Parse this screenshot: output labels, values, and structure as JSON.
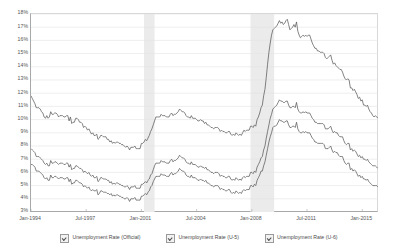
{
  "chart_data": {
    "type": "line",
    "title": "",
    "xlabel": "",
    "ylabel": "",
    "ylim": [
      3,
      18
    ],
    "grid": true,
    "legend_position": "bottom",
    "y_ticks": [
      "18%",
      "17%",
      "16%",
      "15%",
      "14%",
      "13%",
      "12%",
      "11%",
      "10%",
      "9%",
      "8%",
      "7%",
      "6%",
      "5%",
      "4%",
      "3%"
    ],
    "y_tick_values": [
      18,
      17,
      16,
      15,
      14,
      13,
      12,
      11,
      10,
      9,
      8,
      7,
      6,
      5,
      4,
      3
    ],
    "x_ticks": [
      "Jan-1994",
      "Jul-1997",
      "Jan-2001",
      "Jul-2004",
      "Jan-2008",
      "Jul-2011",
      "Jan-2015"
    ],
    "x_start": "Jan-1994",
    "x_end": "Jan-2016",
    "legend": [
      {
        "label": "Unemployment Rate (Official)",
        "checked": true,
        "color": "#5a5a5a"
      },
      {
        "label": "Unemployment Rate (U-5)",
        "checked": true,
        "color": "#5a5a5a"
      },
      {
        "label": "Unemployment Rate (U-6)",
        "checked": true,
        "color": "#5a5a5a"
      }
    ],
    "shaded_regions": [
      {
        "label": "Recession 2001",
        "start": "Mar-2001",
        "end": "Nov-2001",
        "color": "#ebebeb"
      },
      {
        "label": "Recession 2008",
        "start": "Dec-2007",
        "end": "Jun-2009",
        "color": "#ebebeb"
      }
    ],
    "series": [
      {
        "name": "Unemployment Rate (Official)",
        "values": [
          6.6,
          6.6,
          6.5,
          6.4,
          6.1,
          6.1,
          6.1,
          6.0,
          5.9,
          5.8,
          5.6,
          5.5,
          5.6,
          5.4,
          5.4,
          5.8,
          5.6,
          5.6,
          5.7,
          5.7,
          5.6,
          5.5,
          5.6,
          5.6,
          5.6,
          5.5,
          5.5,
          5.6,
          5.6,
          5.3,
          5.5,
          5.1,
          5.2,
          5.2,
          5.4,
          5.4,
          5.3,
          5.2,
          5.2,
          5.1,
          4.9,
          5.0,
          4.9,
          4.8,
          4.9,
          4.7,
          4.6,
          4.7,
          4.6,
          4.6,
          4.7,
          4.3,
          4.4,
          4.6,
          4.6,
          4.5,
          4.5,
          4.5,
          4.4,
          4.4,
          4.3,
          4.4,
          4.2,
          4.3,
          4.2,
          4.3,
          4.3,
          4.2,
          4.2,
          4.1,
          4.1,
          4.0,
          4.0,
          4.1,
          4.0,
          3.8,
          4.0,
          4.0,
          4.0,
          4.1,
          3.9,
          3.9,
          3.9,
          3.9,
          4.2,
          4.2,
          4.3,
          4.4,
          4.3,
          4.5,
          4.6,
          4.9,
          5.0,
          5.3,
          5.5,
          5.7,
          5.7,
          5.7,
          5.7,
          5.9,
          5.8,
          5.8,
          5.8,
          5.7,
          5.7,
          5.7,
          5.9,
          6.0,
          5.8,
          5.9,
          5.9,
          6.0,
          6.1,
          6.3,
          6.2,
          6.1,
          6.1,
          6.0,
          5.8,
          5.7,
          5.7,
          5.6,
          5.8,
          5.6,
          5.6,
          5.6,
          5.5,
          5.4,
          5.4,
          5.5,
          5.4,
          5.4,
          5.3,
          5.4,
          5.2,
          5.2,
          5.1,
          5.0,
          5.0,
          4.9,
          5.0,
          5.0,
          5.0,
          4.9,
          4.7,
          4.8,
          4.7,
          4.7,
          4.6,
          4.6,
          4.7,
          4.7,
          4.5,
          4.4,
          4.5,
          4.4,
          4.6,
          4.5,
          4.4,
          4.5,
          4.4,
          4.6,
          4.7,
          4.6,
          4.7,
          4.7,
          4.7,
          5.0,
          5.0,
          4.9,
          5.1,
          5.0,
          5.4,
          5.6,
          5.8,
          6.1,
          6.1,
          6.5,
          6.8,
          7.3,
          7.8,
          8.3,
          8.7,
          9.0,
          9.4,
          9.5,
          9.5,
          9.6,
          9.8,
          10.0,
          9.9,
          9.9,
          9.8,
          9.8,
          9.9,
          9.9,
          9.6,
          9.4,
          9.4,
          9.5,
          9.5,
          9.4,
          9.8,
          9.3,
          9.1,
          9.0,
          9.0,
          9.1,
          9.0,
          9.1,
          9.0,
          9.0,
          9.0,
          8.8,
          8.6,
          8.5,
          8.3,
          8.3,
          8.2,
          8.2,
          8.2,
          8.2,
          8.2,
          8.1,
          7.8,
          7.8,
          7.8,
          7.9,
          8.0,
          7.7,
          7.5,
          7.6,
          7.5,
          7.5,
          7.3,
          7.2,
          7.2,
          7.2,
          6.9,
          6.7,
          6.6,
          6.7,
          6.7,
          6.2,
          6.3,
          6.1,
          6.2,
          6.1,
          5.9,
          5.7,
          5.8,
          5.6,
          5.7,
          5.5,
          5.5,
          5.4,
          5.5,
          5.3,
          5.2,
          5.1,
          5.0,
          5.0,
          5.0,
          5.0,
          4.9
        ]
      },
      {
        "name": "Unemployment Rate (U-5)",
        "values": [
          7.8,
          7.7,
          7.6,
          7.5,
          7.2,
          7.2,
          7.2,
          7.1,
          7.0,
          6.9,
          6.7,
          6.6,
          6.7,
          6.5,
          6.5,
          6.9,
          6.7,
          6.7,
          6.8,
          6.8,
          6.7,
          6.6,
          6.7,
          6.7,
          6.7,
          6.6,
          6.6,
          6.7,
          6.7,
          6.4,
          6.6,
          6.2,
          6.3,
          6.3,
          6.5,
          6.5,
          6.4,
          6.3,
          6.3,
          6.2,
          6.0,
          6.1,
          6.0,
          5.9,
          6.0,
          5.8,
          5.7,
          5.8,
          5.6,
          5.6,
          5.7,
          5.3,
          5.4,
          5.6,
          5.6,
          5.5,
          5.5,
          5.5,
          5.4,
          5.4,
          5.2,
          5.3,
          5.1,
          5.2,
          5.1,
          5.2,
          5.2,
          5.1,
          5.1,
          5.0,
          5.0,
          4.9,
          4.9,
          5.0,
          4.9,
          4.7,
          4.9,
          4.9,
          4.9,
          5.0,
          4.8,
          4.8,
          4.8,
          4.8,
          5.1,
          5.1,
          5.2,
          5.3,
          5.2,
          5.4,
          5.5,
          5.8,
          5.9,
          6.2,
          6.5,
          6.7,
          6.7,
          6.7,
          6.7,
          6.9,
          6.8,
          6.8,
          6.8,
          6.7,
          6.7,
          6.7,
          6.9,
          7.0,
          6.8,
          6.9,
          6.9,
          7.0,
          7.1,
          7.3,
          7.2,
          7.1,
          7.1,
          7.0,
          6.8,
          6.7,
          6.7,
          6.6,
          6.8,
          6.6,
          6.6,
          6.6,
          6.5,
          6.4,
          6.4,
          6.5,
          6.4,
          6.4,
          6.3,
          6.4,
          6.2,
          6.2,
          6.1,
          6.0,
          6.0,
          5.9,
          6.0,
          6.0,
          6.0,
          5.9,
          5.7,
          5.8,
          5.7,
          5.7,
          5.6,
          5.6,
          5.7,
          5.7,
          5.5,
          5.4,
          5.5,
          5.4,
          5.6,
          5.5,
          5.4,
          5.5,
          5.4,
          5.6,
          5.7,
          5.6,
          5.7,
          5.7,
          5.7,
          6.0,
          6.0,
          5.9,
          6.1,
          6.0,
          6.4,
          6.6,
          6.8,
          7.1,
          7.2,
          7.7,
          8.0,
          8.6,
          9.1,
          9.6,
          10.1,
          10.4,
          10.8,
          10.9,
          11.0,
          11.1,
          11.3,
          11.5,
          11.4,
          11.4,
          11.3,
          11.3,
          11.4,
          11.4,
          11.1,
          10.9,
          10.9,
          11.0,
          11.0,
          10.9,
          11.3,
          10.8,
          10.6,
          10.5,
          10.5,
          10.6,
          10.5,
          10.6,
          10.5,
          10.5,
          10.5,
          10.3,
          10.1,
          10.0,
          9.8,
          9.8,
          9.7,
          9.7,
          9.7,
          9.7,
          9.7,
          9.6,
          9.3,
          9.3,
          9.3,
          9.4,
          9.5,
          9.2,
          9.0,
          9.1,
          9.0,
          9.0,
          8.8,
          8.7,
          8.7,
          8.7,
          8.4,
          8.2,
          8.1,
          8.2,
          8.2,
          7.7,
          7.8,
          7.6,
          7.7,
          7.6,
          7.4,
          7.2,
          7.3,
          7.1,
          7.2,
          7.0,
          7.0,
          6.9,
          7.0,
          6.8,
          6.7,
          6.6,
          6.5,
          6.5,
          6.5,
          6.4,
          6.3
        ]
      },
      {
        "name": "Unemployment Rate (U-6)",
        "values": [
          11.8,
          11.6,
          11.4,
          11.2,
          10.9,
          10.9,
          10.9,
          10.8,
          10.6,
          10.5,
          10.2,
          10.1,
          10.3,
          10.1,
          10.2,
          10.6,
          10.4,
          10.4,
          10.5,
          10.5,
          10.4,
          10.2,
          10.3,
          10.3,
          10.3,
          10.2,
          10.2,
          10.3,
          10.3,
          9.9,
          10.2,
          9.7,
          9.8,
          9.8,
          10.1,
          10.1,
          10.0,
          9.8,
          9.8,
          9.7,
          9.4,
          9.5,
          9.4,
          9.2,
          9.3,
          9.1,
          8.9,
          9.0,
          8.8,
          8.8,
          8.9,
          8.5,
          8.6,
          8.8,
          8.8,
          8.7,
          8.7,
          8.7,
          8.5,
          8.5,
          8.3,
          8.4,
          8.2,
          8.3,
          8.2,
          8.3,
          8.3,
          8.2,
          8.2,
          8.1,
          8.1,
          8.0,
          7.9,
          8.0,
          7.9,
          7.7,
          7.9,
          7.9,
          7.9,
          8.0,
          7.8,
          7.8,
          7.8,
          7.8,
          8.2,
          8.2,
          8.3,
          8.5,
          8.4,
          8.6,
          8.8,
          9.1,
          9.3,
          9.6,
          9.9,
          10.2,
          10.2,
          10.2,
          10.2,
          10.4,
          10.3,
          10.3,
          10.3,
          10.2,
          10.2,
          10.2,
          10.4,
          10.5,
          10.3,
          10.4,
          10.4,
          10.5,
          10.6,
          10.8,
          10.7,
          10.6,
          10.6,
          10.5,
          10.3,
          10.2,
          10.2,
          10.1,
          10.3,
          10.1,
          10.1,
          10.1,
          10.0,
          9.9,
          9.9,
          10.0,
          9.9,
          9.9,
          9.7,
          9.8,
          9.6,
          9.6,
          9.5,
          9.4,
          9.4,
          9.3,
          9.4,
          9.4,
          9.4,
          9.3,
          9.1,
          9.2,
          9.1,
          9.1,
          9.0,
          9.0,
          9.1,
          9.1,
          8.9,
          8.8,
          8.9,
          8.8,
          9.0,
          8.9,
          8.8,
          8.9,
          8.8,
          9.0,
          9.2,
          9.1,
          9.2,
          9.2,
          9.2,
          9.5,
          9.5,
          9.4,
          9.6,
          9.5,
          10.0,
          10.2,
          10.5,
          10.9,
          11.1,
          11.8,
          12.3,
          13.2,
          14.2,
          15.1,
          15.8,
          16.4,
          16.8,
          16.9,
          17.0,
          17.1,
          17.3,
          17.5,
          17.3,
          17.4,
          17.2,
          17.3,
          17.5,
          17.6,
          17.2,
          16.8,
          16.9,
          17.0,
          17.2,
          17.0,
          17.4,
          16.7,
          16.4,
          16.2,
          16.3,
          16.4,
          16.3,
          16.4,
          16.3,
          16.4,
          16.4,
          16.1,
          15.8,
          15.6,
          15.4,
          15.4,
          15.2,
          15.2,
          15.1,
          15.1,
          15.1,
          15.0,
          14.7,
          14.6,
          14.7,
          14.8,
          14.9,
          14.5,
          14.2,
          14.3,
          14.1,
          14.0,
          13.9,
          13.8,
          13.8,
          13.6,
          13.3,
          13.1,
          13.0,
          13.1,
          13.0,
          12.4,
          12.4,
          12.2,
          12.3,
          12.1,
          11.9,
          11.6,
          11.7,
          11.4,
          11.5,
          11.1,
          11.1,
          11.0,
          11.1,
          10.8,
          10.6,
          10.5,
          10.3,
          10.2,
          10.3,
          10.2,
          10.1
        ]
      }
    ]
  }
}
